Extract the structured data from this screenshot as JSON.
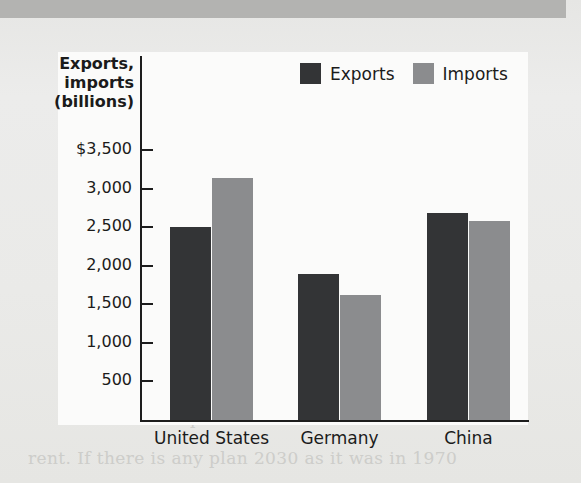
{
  "page": {
    "background_color": "#e9e9e7",
    "top_band_color": "#b3b3b1",
    "panel_color": "#fbfbfa",
    "bleed_through_text": [
      "the age of massive oil imports",
      "world oil trade during that period to",
      "a very large part of the global oil",
      "trade in the early 1970s. In 1975,",
      "grew to nearly 120 million barrels",
      "the world's cost of imported oil",
      "while McDonald's was getting into",
      "houses operated in the U.S. with the",
      "as the commerce of that nation",
      "as happened. It was at this time that",
      "saw 8.5 million barrels a day. The",
      "ties to a growing body of proof to",
      "percent of the world's installed",
      "rent. If there is any plan 2030 as it was in 1970"
    ]
  },
  "chart_data": {
    "type": "bar",
    "title": "",
    "subtitle": "",
    "ylabel": "Exports, imports (billions)",
    "xlabel": "",
    "categories": [
      "United States",
      "Germany",
      "China"
    ],
    "series": [
      {
        "name": "Exports",
        "color": "#333436",
        "values": [
          2500,
          1890,
          2680
        ]
      },
      {
        "name": "Imports",
        "color": "#8b8c8e",
        "values": [
          3135,
          1620,
          2580
        ]
      }
    ],
    "ylim": [
      0,
      3500
    ],
    "y_ticks": [
      500,
      1000,
      1500,
      2000,
      2500,
      3000,
      3500
    ],
    "y_tick_labels": [
      "500",
      "1,000",
      "1,500",
      "2,000",
      "2,500",
      "3,000",
      "$3,500"
    ],
    "grid": false,
    "legend_position": "top-right",
    "legend": [
      "Exports",
      "Imports"
    ]
  },
  "axis": {
    "title_line1": "Exports,",
    "title_line2": "imports",
    "title_line3": "(billions)"
  }
}
